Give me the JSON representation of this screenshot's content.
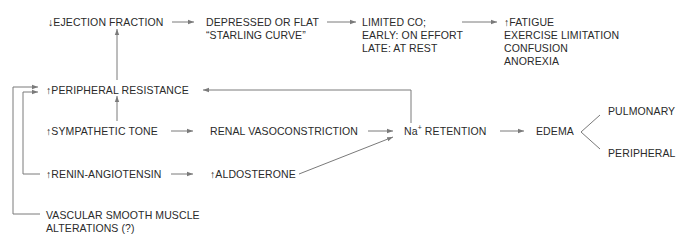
{
  "diagram": {
    "nodes": {
      "ejection_fraction": {
        "lines": [
          "↓EJECTION FRACTION"
        ]
      },
      "starling": {
        "lines": [
          "DEPRESSED OR FLAT",
          "“STARLING CURVE”"
        ]
      },
      "limited_co": {
        "lines": [
          "LIMITED CO;",
          "EARLY: ON EFFORT",
          "LATE: AT REST"
        ]
      },
      "symptoms": {
        "lines": [
          "↑FATIGUE",
          "EXERCISE LIMITATION",
          "CONFUSION",
          "ANOREXIA"
        ]
      },
      "peripheral_resistance": {
        "lines": [
          "↑PERIPHERAL RESISTANCE"
        ]
      },
      "sympathetic_tone": {
        "lines": [
          "↑SYMPATHETIC TONE"
        ]
      },
      "renal_vasoconstriction": {
        "lines": [
          "RENAL VASOCONSTRICTION"
        ]
      },
      "na_retention": {
        "prefix": "Na",
        "superscript": "+",
        "suffix": " RETENTION"
      },
      "edema": {
        "lines": [
          "EDEMA"
        ]
      },
      "pulmonary": {
        "lines": [
          "PULMONARY"
        ]
      },
      "peripheral": {
        "lines": [
          "PERIPHERAL"
        ]
      },
      "renin_angiotensin": {
        "lines": [
          "↑RENIN-ANGIOTENSIN"
        ]
      },
      "aldosterone": {
        "lines": [
          "↑ALDOSTERONE"
        ]
      },
      "vascular_smooth_muscle": {
        "lines": [
          "VASCULAR SMOOTH MUSCLE",
          "ALTERATIONS (?)"
        ]
      }
    },
    "edges": [
      {
        "from": "ejection_fraction",
        "to": "starling"
      },
      {
        "from": "starling",
        "to": "limited_co"
      },
      {
        "from": "limited_co",
        "to": "symptoms"
      },
      {
        "from": "peripheral_resistance",
        "to": "ejection_fraction"
      },
      {
        "from": "sympathetic_tone",
        "to": "peripheral_resistance"
      },
      {
        "from": "sympathetic_tone",
        "to": "renal_vasoconstriction"
      },
      {
        "from": "renal_vasoconstriction",
        "to": "na_retention"
      },
      {
        "from": "na_retention",
        "to": "peripheral_resistance"
      },
      {
        "from": "na_retention",
        "to": "edema"
      },
      {
        "from": "edema",
        "to": "pulmonary"
      },
      {
        "from": "edema",
        "to": "peripheral"
      },
      {
        "from": "renin_angiotensin",
        "to": "aldosterone"
      },
      {
        "from": "aldosterone",
        "to": "na_retention"
      },
      {
        "from": "renin_angiotensin",
        "to": "peripheral_resistance"
      },
      {
        "from": "vascular_smooth_muscle",
        "to": "peripheral_resistance"
      }
    ],
    "colors": {
      "text": "#2a2a2a",
      "line": "#7a7a7a",
      "background": "#ffffff"
    }
  }
}
